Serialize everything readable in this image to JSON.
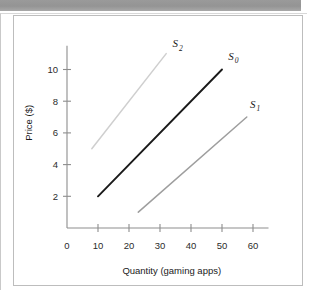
{
  "banner": {
    "title": "THE SUPPLY CURVE"
  },
  "chart_data": {
    "type": "line",
    "title": "",
    "xlabel": "Quantity (gaming apps)",
    "ylabel": "Price ($)",
    "xlim": [
      0,
      65
    ],
    "ylim": [
      0,
      11.5
    ],
    "xticks": [
      0,
      10,
      20,
      30,
      40,
      50,
      60
    ],
    "yticks": [
      2,
      4,
      6,
      8,
      10
    ],
    "xticklabels": [
      "0",
      "10",
      "20",
      "30",
      "40",
      "50",
      "60"
    ],
    "yticklabels": [
      "2",
      "4",
      "6",
      "8",
      "10"
    ],
    "grid": false,
    "legend": "inline-labels",
    "series": [
      {
        "name": "S2",
        "label": "S",
        "subscript": "2",
        "color": "#cfcfcf",
        "points": [
          [
            8,
            5
          ],
          [
            32,
            11
          ]
        ],
        "label_position": [
          34,
          11.4
        ]
      },
      {
        "name": "S0",
        "label": "S",
        "subscript": "0",
        "color": "#1a1a1a",
        "points": [
          [
            10,
            2
          ],
          [
            50,
            10
          ]
        ],
        "label_position": [
          52,
          10.6
        ]
      },
      {
        "name": "S1",
        "label": "S",
        "subscript": "1",
        "color": "#9e9e9e",
        "points": [
          [
            23,
            1
          ],
          [
            58,
            7
          ]
        ],
        "label_position": [
          59,
          7.6
        ]
      }
    ]
  },
  "colors": {
    "banner_bg": "#9a9a9a",
    "panel_border": "#bdbdbd",
    "axis": "#8d8d8d",
    "text": "#1a1a1a"
  }
}
